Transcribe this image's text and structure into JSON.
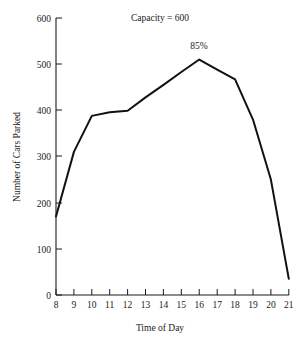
{
  "chart_data": {
    "type": "line",
    "title": "",
    "xlabel": "Time of Day",
    "ylabel": "Number of Cars Parked",
    "x": [
      8,
      9,
      10,
      11,
      12,
      13,
      14,
      15,
      16,
      17,
      18,
      19,
      20,
      21
    ],
    "values": [
      170,
      310,
      388,
      396,
      399,
      428,
      455,
      483,
      510,
      488,
      467,
      380,
      250,
      35
    ],
    "xlim": [
      8,
      21
    ],
    "ylim": [
      0,
      600
    ],
    "xticks": [
      8,
      9,
      10,
      11,
      12,
      13,
      14,
      15,
      16,
      17,
      18,
      19,
      20,
      21
    ],
    "yticks": [
      0,
      100,
      200,
      300,
      400,
      500,
      600
    ],
    "xtick_labels": [
      "8",
      "9",
      "10",
      "11",
      "12",
      "13",
      "14",
      "15",
      "16",
      "17",
      "18",
      "19",
      "20",
      "21"
    ],
    "ytick_labels": [
      "0",
      "100",
      "200",
      "300",
      "400",
      "500",
      "600"
    ],
    "grid": false,
    "legend": false,
    "annotations": [
      {
        "text": "Capacity = 600",
        "x": 12.6,
        "y": 600
      },
      {
        "text": "85%",
        "x": 16,
        "y": 556
      }
    ],
    "series": [
      {
        "name": "Cars Parked",
        "color": "#111111",
        "values": [
          170,
          310,
          388,
          396,
          399,
          428,
          455,
          483,
          510,
          488,
          467,
          380,
          250,
          35
        ]
      }
    ]
  },
  "axes": {
    "x_title": "Time of Day",
    "y_title": "Number of Cars Parked"
  },
  "annotations": {
    "capacity": "Capacity = 600",
    "peak": "85%"
  }
}
